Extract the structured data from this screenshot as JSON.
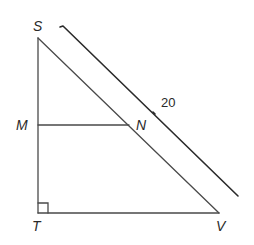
{
  "figure": {
    "vertices": {
      "S": "S",
      "T": "T",
      "V": "V",
      "M": "M",
      "N": "N"
    },
    "segments": [
      "ST",
      "TV",
      "SV",
      "MN"
    ],
    "right_angle_at": "T",
    "measurements": {
      "SV_length_label": "20"
    },
    "colors": {
      "line": "#4a4a4a",
      "dimension_line": "#2a2a2a",
      "text": "#2a2a2a",
      "background": "#ffffff"
    }
  }
}
